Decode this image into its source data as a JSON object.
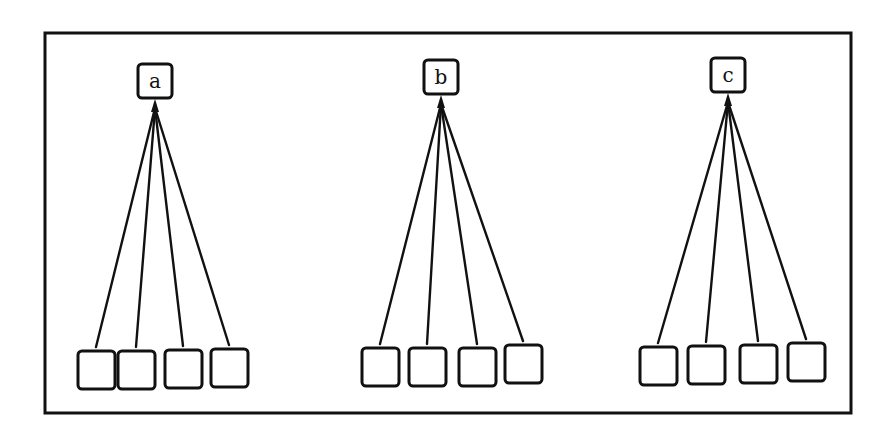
{
  "diagram": {
    "type": "tree",
    "colors": {
      "stroke": "#111111",
      "background": "#ffffff"
    },
    "trees": [
      {
        "root": {
          "label": "a",
          "x": 155,
          "y": 81
        },
        "children": [
          {
            "x": 96,
            "y": 370
          },
          {
            "x": 136,
            "y": 370
          },
          {
            "x": 183,
            "y": 369
          },
          {
            "x": 229,
            "y": 368
          }
        ]
      },
      {
        "root": {
          "label": "b",
          "x": 441,
          "y": 77
        },
        "children": [
          {
            "x": 380,
            "y": 367
          },
          {
            "x": 427,
            "y": 367
          },
          {
            "x": 477,
            "y": 367
          },
          {
            "x": 523,
            "y": 364
          }
        ]
      },
      {
        "root": {
          "label": "c",
          "x": 728,
          "y": 75
        },
        "children": [
          {
            "x": 658,
            "y": 366
          },
          {
            "x": 706,
            "y": 365
          },
          {
            "x": 758,
            "y": 364
          },
          {
            "x": 806,
            "y": 362
          }
        ]
      }
    ]
  }
}
